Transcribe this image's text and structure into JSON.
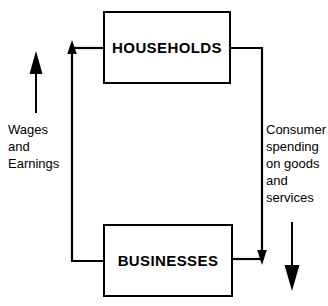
{
  "diagram": {
    "background_color": "#ffffff",
    "line_color": "#000000",
    "text_color": "#000000",
    "nodes": [
      {
        "id": "households",
        "label": "HOUSEHOLDS",
        "x": 103,
        "y": 11,
        "width": 128,
        "height": 73
      },
      {
        "id": "businesses",
        "label": "BUSINESSES",
        "x": 103,
        "y": 224,
        "width": 130,
        "height": 73
      }
    ],
    "flows": [
      {
        "id": "wages-flow",
        "label": "Wages\nand\nEarnings",
        "direction": "up",
        "from": "businesses",
        "to": "households",
        "side": "left"
      },
      {
        "id": "consumer-spending-flow",
        "label": "Consumer\nspending\non goods\nand\nservices",
        "direction": "down",
        "from": "households",
        "to": "businesses",
        "side": "right"
      }
    ]
  }
}
